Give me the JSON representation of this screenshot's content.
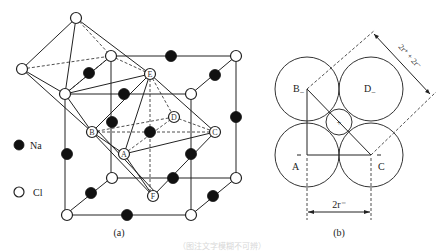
{
  "panel_a": {
    "caption": "(a)",
    "legend": [
      {
        "symbol": "filled-circle",
        "label": "Na"
      },
      {
        "symbol": "open-circle",
        "label": "Cl"
      }
    ],
    "atom_labels": {
      "A": "A",
      "B": "B",
      "C": "C",
      "D": "D",
      "E": "E",
      "F": "F"
    }
  },
  "panel_b": {
    "caption": "(b)",
    "circle_labels": {
      "B": "B",
      "D": "D",
      "A": "A",
      "C": "C",
      "center": "+"
    },
    "anion_suffix": "−",
    "dimension_diagonal": "2r⁺ + 2r⁻",
    "dimension_horizontal": "2r⁻"
  },
  "figure_caption": "（图注文字模糊不可辨）"
}
